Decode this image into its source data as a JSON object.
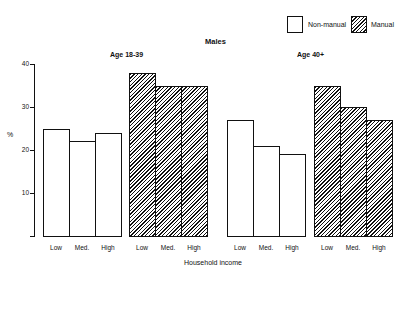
{
  "chart_data": {
    "type": "bar",
    "title": "Males",
    "xlabel": "Household income",
    "ylabel": "%",
    "ylim": [
      0,
      40
    ],
    "yticks": [
      10,
      20,
      30,
      40
    ],
    "grid": false,
    "legend_position": "top-right",
    "legend": [
      {
        "name": "Non-manual",
        "style": "white"
      },
      {
        "name": "Manual",
        "style": "hatched"
      }
    ],
    "panels": [
      {
        "label": "Age 18-39",
        "categories": [
          "Low",
          "Med.",
          "High"
        ],
        "series": [
          {
            "name": "Non-manual",
            "values": [
              25,
              22,
              24
            ]
          },
          {
            "name": "Manual",
            "values": [
              38,
              35,
              35
            ]
          }
        ]
      },
      {
        "label": "Age 40+",
        "categories": [
          "Low",
          "Med.",
          "High"
        ],
        "series": [
          {
            "name": "Non-manual",
            "values": [
              27,
              21,
              19
            ]
          },
          {
            "name": "Manual",
            "values": [
              35,
              30,
              27
            ]
          }
        ]
      }
    ]
  },
  "ui": {
    "title": "Males",
    "xlabel": "Household income",
    "ylabel": "%",
    "panel_labels": [
      "Age 18-39",
      "Age 40+"
    ],
    "legend": [
      "Non-manual",
      "Manual"
    ],
    "yticks": [
      "10",
      "20",
      "30",
      "40"
    ],
    "categories": [
      "Low",
      "Med.",
      "High"
    ]
  }
}
